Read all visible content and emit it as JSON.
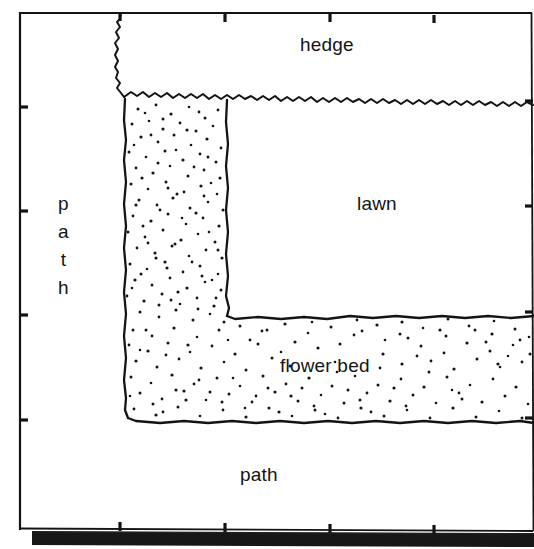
{
  "figure": {
    "type": "garden-plan-diagram",
    "background_color": "#ffffff",
    "ink_color": "#141414",
    "frame": {
      "name": "plot-frame",
      "x": 20,
      "y": 12,
      "width": 510,
      "height": 517,
      "stroke_width": 2
    },
    "baseline_band": {
      "name": "bottom-black-band",
      "color": "#171717",
      "x": 32,
      "y": 530,
      "width": 502,
      "height": 14
    },
    "ticks": {
      "top": [
        120,
        225,
        330,
        434
      ],
      "bottom": [
        120,
        225,
        330,
        434
      ],
      "left": [
        107,
        211,
        315,
        420
      ],
      "right": [
        107,
        211,
        315,
        420
      ],
      "length": 8,
      "stroke_width": 3
    },
    "regions": [
      {
        "id": "hedge",
        "label": "hedge",
        "fill": "none",
        "label_x": 300,
        "label_y": 34
      },
      {
        "id": "lawn",
        "label": "lawn",
        "fill": "none",
        "label_x": 357,
        "label_y": 193
      },
      {
        "id": "flower-bed",
        "label": "flower bed",
        "fill": "stipple",
        "label_x": 280,
        "label_y": 355,
        "shape": "L-shaped",
        "bounds": {
          "left": 124,
          "top": 96,
          "right": 534,
          "bottom": 422
        },
        "inner_corner": {
          "x": 227,
          "y": 318
        },
        "dot_count": 560
      },
      {
        "id": "path-left",
        "label": "path",
        "orientation": "vertical-stacked",
        "letters": [
          "p",
          "a",
          "t",
          "h"
        ],
        "label_x": 58,
        "label_y": 190
      },
      {
        "id": "path-bottom",
        "label": "path",
        "orientation": "horizontal",
        "label_x": 240,
        "label_y": 464
      }
    ]
  },
  "labels": {
    "hedge": "hedge",
    "lawn": "lawn",
    "flower_bed": "flower bed",
    "path_bottom": "path",
    "path_left_letters": {
      "l1": "p",
      "l2": "a",
      "l3": "t",
      "l4": "h"
    }
  }
}
